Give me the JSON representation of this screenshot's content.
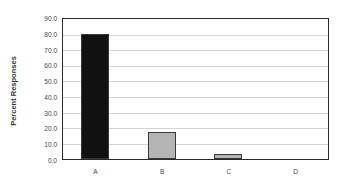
{
  "chart_data": {
    "type": "bar",
    "title": "",
    "xlabel": "",
    "ylabel": "Percent Responses",
    "categories": [
      "A",
      "B",
      "C",
      "D"
    ],
    "values": [
      79.8,
      17.1,
      3.5,
      0.0
    ],
    "bar_colors": [
      "#111111",
      "#b4b4b4",
      "#b4b4b4",
      "#b4b4b4"
    ],
    "ylim": [
      0,
      90
    ],
    "yticks": [
      "0.0",
      "10.0",
      "20.0",
      "30.0",
      "40.0",
      "50.0",
      "60.0",
      "70.0",
      "80.0",
      "90.0"
    ],
    "grid": true,
    "legend": null
  }
}
